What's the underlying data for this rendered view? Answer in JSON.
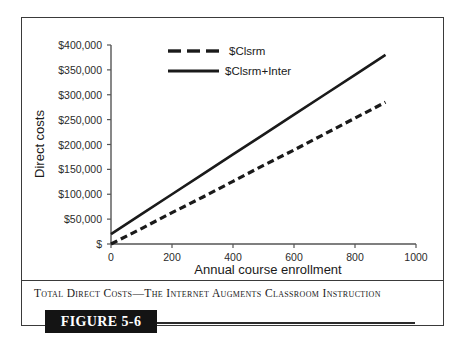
{
  "figure": {
    "badge_label": "FIGURE 5-6",
    "caption": "Total Direct Costs—The Internet Augments Classroom Instruction"
  },
  "chart_data": {
    "type": "line",
    "title": "",
    "xlabel": "Annual course enrollment",
    "ylabel": "Direct costs",
    "xlim": [
      0,
      1000
    ],
    "ylim": [
      0,
      400000
    ],
    "xticks": [
      0,
      200,
      400,
      600,
      800,
      1000
    ],
    "xtick_labels": [
      "0",
      "200",
      "400",
      "600",
      "800",
      "1000"
    ],
    "yticks": [
      0,
      50000,
      100000,
      150000,
      200000,
      250000,
      300000,
      350000,
      400000
    ],
    "ytick_labels": [
      "$",
      "$50,000",
      "$100,000",
      "$150,000",
      "$200,000",
      "$250,000",
      "$300,000",
      "$350,000",
      "$400,000"
    ],
    "grid": false,
    "legend_position": "upper center",
    "x": [
      0,
      100,
      200,
      300,
      400,
      500,
      600,
      700,
      800,
      900
    ],
    "series": [
      {
        "name": "$Clsrm",
        "style": "dashed",
        "color": "#1a1a1a",
        "values": [
          0,
          31000,
          63000,
          94000,
          126000,
          158000,
          189000,
          221000,
          253000,
          285000
        ]
      },
      {
        "name": "$Clsrm+Inter",
        "style": "solid",
        "color": "#1a1a1a",
        "values": [
          20000,
          60000,
          100000,
          140000,
          180000,
          220000,
          260000,
          300000,
          340000,
          380000
        ]
      }
    ]
  }
}
